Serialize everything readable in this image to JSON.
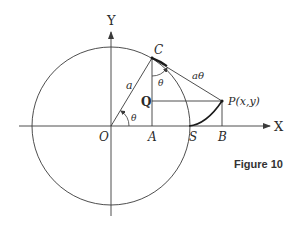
{
  "figure": {
    "caption": "Figure 10",
    "axes": {
      "x_label": "X",
      "y_label": "Y"
    },
    "points": {
      "origin": "O",
      "C": "C",
      "A": "A",
      "Q": "Q",
      "S": "S",
      "B": "B",
      "P": "P(x,y)"
    },
    "segment_labels": {
      "radius": "a",
      "tangent": "aθ",
      "angle_at_origin": "θ",
      "angle_at_C": "θ"
    },
    "colors": {
      "line": "#3a3a3a",
      "curve": "#1a1a1a",
      "background": "#ffffff"
    }
  }
}
